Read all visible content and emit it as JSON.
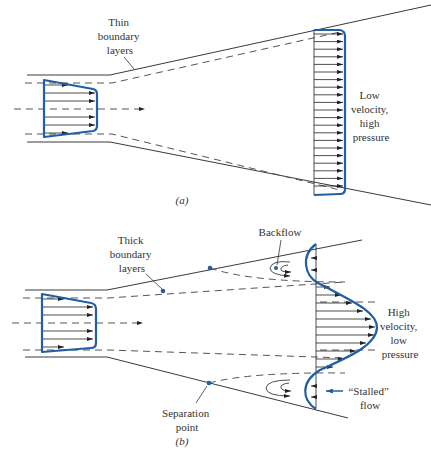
{
  "figure": {
    "panel_a": {
      "caption": "(a)",
      "label_thin": [
        "Thin",
        "boundary",
        "layers"
      ],
      "label_right": [
        "Low",
        "velocity,",
        "high",
        "pressure"
      ]
    },
    "panel_b": {
      "caption": "(b)",
      "label_thick": [
        "Thick",
        "boundary",
        "layers"
      ],
      "label_backflow": "Backflow",
      "label_right": [
        "High",
        "velocity,",
        "low",
        "pressure"
      ],
      "label_stalled": [
        "“Stalled”",
        "flow"
      ],
      "label_separation": [
        "Separation",
        "point"
      ]
    },
    "colors": {
      "profile": "#1f5fa6",
      "lines": "#3a3a3a"
    }
  }
}
